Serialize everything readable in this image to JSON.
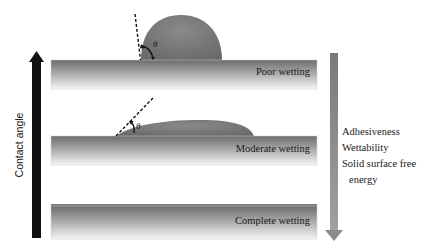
{
  "left_axis": {
    "label": "Contact angle",
    "direction": "up",
    "color": "#111111"
  },
  "right_axis": {
    "direction": "down",
    "color": "#8a8a8a",
    "labels": [
      "Adhesiveness",
      "Wettability",
      "Solid surface free",
      "energy"
    ]
  },
  "plates": [
    {
      "label": "Poor wetting",
      "angle_symbol": "θ"
    },
    {
      "label": "Moderate wetting",
      "angle_symbol": "θ"
    },
    {
      "label": "Complete wetting"
    }
  ],
  "colors": {
    "droplet": "#7a7a7a",
    "plate_top": "#6e6e6e",
    "plate_bottom": "#f4f4f4"
  }
}
